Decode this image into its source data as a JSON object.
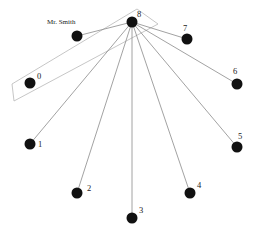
{
  "diagram": {
    "type": "star-graph",
    "center_node": "8",
    "colors": {
      "node": "#111111",
      "edge": "#8a8a8a",
      "selection": "#b8b8b8",
      "label": "#222222",
      "background": "#ffffff"
    },
    "nodes": [
      {
        "id": "8",
        "label": "8",
        "x": 132,
        "y": 22,
        "lx": 137,
        "ly": 17
      },
      {
        "id": "smith",
        "label": "Mr. Smith",
        "x": 77,
        "y": 36,
        "lx": 47,
        "ly": 24
      },
      {
        "id": "7",
        "label": "7",
        "x": 187,
        "y": 39,
        "lx": 183,
        "ly": 31
      },
      {
        "id": "0",
        "label": "0",
        "x": 30,
        "y": 83,
        "lx": 37,
        "ly": 79
      },
      {
        "id": "6",
        "label": "6",
        "x": 237,
        "y": 84,
        "lx": 233,
        "ly": 74
      },
      {
        "id": "1",
        "label": "1",
        "x": 30,
        "y": 144,
        "lx": 38,
        "ly": 147
      },
      {
        "id": "5",
        "label": "5",
        "x": 237,
        "y": 147,
        "lx": 238,
        "ly": 139
      },
      {
        "id": "2",
        "label": "2",
        "x": 77,
        "y": 193,
        "lx": 87,
        "ly": 191
      },
      {
        "id": "4",
        "label": "4",
        "x": 190,
        "y": 193,
        "lx": 197,
        "ly": 188
      },
      {
        "id": "3",
        "label": "3",
        "x": 132,
        "y": 218,
        "lx": 139,
        "ly": 213
      }
    ],
    "edges": [
      {
        "from": "8",
        "to": "smith"
      },
      {
        "from": "8",
        "to": "7"
      },
      {
        "from": "8",
        "to": "6"
      },
      {
        "from": "8",
        "to": "5"
      },
      {
        "from": "8",
        "to": "4"
      },
      {
        "from": "8",
        "to": "3"
      },
      {
        "from": "8",
        "to": "2"
      },
      {
        "from": "8",
        "to": "1"
      }
    ],
    "selection_polygon": [
      [
        12,
        84
      ],
      [
        137,
        9
      ],
      [
        158,
        24
      ],
      [
        14,
        101
      ]
    ]
  }
}
